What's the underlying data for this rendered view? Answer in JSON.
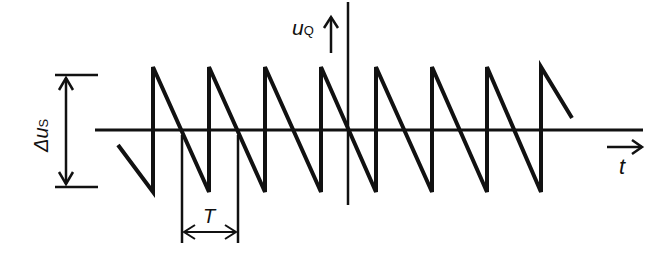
{
  "diagram": {
    "labels": {
      "y_axis": "u",
      "y_axis_sub": "Q",
      "x_axis": "t",
      "amplitude": "Δu",
      "amplitude_sub": "S",
      "period": "T"
    },
    "colors": {
      "stroke": "#111111",
      "background": "#ffffff"
    },
    "waveform": {
      "type": "sawtooth",
      "peaks_x": [
        153,
        209,
        265,
        321,
        376,
        432,
        487,
        541
      ],
      "top_y": 67,
      "bottom_y": 192,
      "baseline_y": 130,
      "period_px": 56
    }
  }
}
